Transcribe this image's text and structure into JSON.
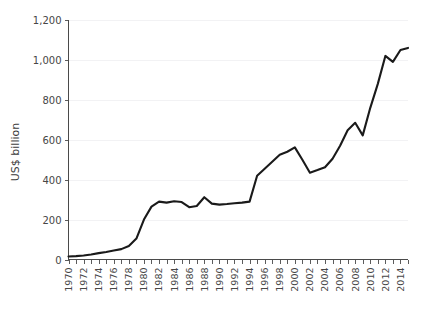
{
  "chart_data": {
    "type": "line",
    "title": "",
    "subtitle": "",
    "xlabel": "",
    "ylabel": "US$ billion",
    "xlim": [
      1970,
      2015
    ],
    "ylim": [
      0,
      1200
    ],
    "grid": true,
    "legend": false,
    "legend_position": "none",
    "line_color": "#1a1a1a",
    "background_color": "#ffffff",
    "gridline_color": "#f2f2f4",
    "axis_color": "#4a4a4a",
    "y_ticks": [
      0,
      200,
      400,
      600,
      800,
      1000,
      1200
    ],
    "y_tick_labels": [
      "0",
      "200",
      "400",
      "600",
      "800",
      "1,000",
      "1,200"
    ],
    "x_tick_labels": [
      "1970",
      "1972",
      "1974",
      "1976",
      "1978",
      "1980",
      "1982",
      "1984",
      "1986",
      "1988",
      "1990",
      "1992",
      "1994",
      "1996",
      "1998",
      "2000",
      "2002",
      "2004",
      "2006",
      "2008",
      "2010",
      "2012",
      "2014"
    ],
    "x_tick_values": [
      1970,
      1972,
      1974,
      1976,
      1978,
      1980,
      1982,
      1984,
      1986,
      1988,
      1990,
      1992,
      1994,
      1996,
      1998,
      2000,
      2002,
      2004,
      2006,
      2008,
      2010,
      2012,
      2014
    ],
    "x_minor_ticks_every": 1,
    "series": [
      {
        "name": "US$ billion",
        "x": [
          1970,
          1971,
          1972,
          1973,
          1974,
          1975,
          1976,
          1977,
          1978,
          1979,
          1980,
          1981,
          1982,
          1983,
          1984,
          1985,
          1986,
          1987,
          1988,
          1989,
          1990,
          1991,
          1992,
          1993,
          1994,
          1995,
          1996,
          1997,
          1998,
          1999,
          2000,
          2001,
          2002,
          2003,
          2004,
          2005,
          2006,
          2007,
          2008,
          2009,
          2010,
          2011,
          2012,
          2013,
          2014,
          2015
        ],
        "values": [
          15,
          17,
          20,
          25,
          32,
          38,
          45,
          52,
          68,
          105,
          200,
          265,
          290,
          285,
          292,
          288,
          262,
          268,
          312,
          280,
          275,
          278,
          282,
          285,
          290,
          420,
          455,
          490,
          525,
          540,
          562,
          500,
          435,
          448,
          462,
          505,
          570,
          648,
          685,
          622,
          760,
          880,
          1020,
          990,
          1050,
          1060
        ]
      }
    ]
  },
  "axis_title": {
    "y": "US$ billion"
  }
}
